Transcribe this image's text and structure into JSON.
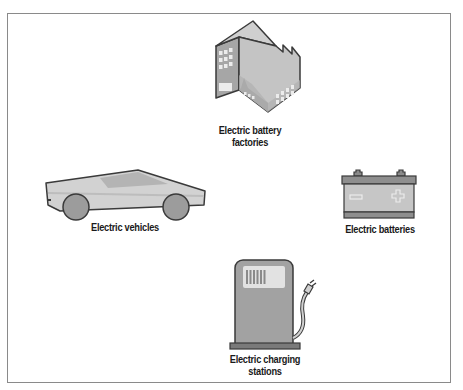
{
  "diagram": {
    "type": "icon-layout",
    "nodes": [
      {
        "id": "factories",
        "label_line1": "Electric battery",
        "label_line2": "factories",
        "icon": "factory-icon",
        "position": "top"
      },
      {
        "id": "vehicles",
        "label_line1": "Electric vehicles",
        "label_line2": "",
        "icon": "car-icon",
        "position": "left"
      },
      {
        "id": "batteries",
        "label_line1": "Electric batteries",
        "label_line2": "",
        "icon": "battery-icon",
        "position": "right"
      },
      {
        "id": "stations",
        "label_line1": "Electric charging",
        "label_line2": "stations",
        "icon": "charging-station-icon",
        "position": "bottom"
      }
    ],
    "colors": {
      "outline": "#3a3a3a",
      "fill_light": "#d4d4d4",
      "fill_mid": "#a8a8a8",
      "fill_dark": "#7a7a7a",
      "frame_border": "#8a8a8a"
    }
  }
}
